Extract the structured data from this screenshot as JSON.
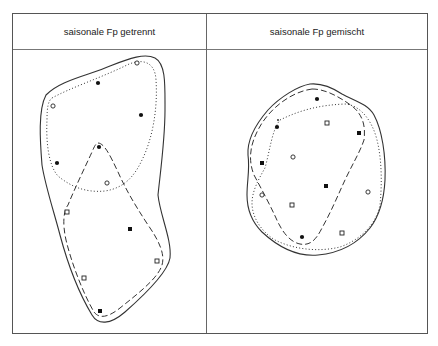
{
  "columns": [
    {
      "title": "saisonale Fp getrennt"
    },
    {
      "title": "saisonale Fp gemischt"
    }
  ],
  "legend_symbols": {
    "filled-circle": "filled circle marker",
    "open-circle": "open circle marker",
    "filled-square": "filled square marker",
    "open-square": "open square marker",
    "solid-outline": "solid outer envelope",
    "dotted-outline": "dotted group envelope",
    "dashed-outline": "dashed group envelope"
  },
  "colors": {
    "line": "#333333",
    "frame": "#555555",
    "background": "#ffffff"
  },
  "left_panel": {
    "markers": [
      {
        "type": "open-circle",
        "x": 137,
        "y": 63
      },
      {
        "type": "filled-circle",
        "x": 98,
        "y": 83
      },
      {
        "type": "open-circle",
        "x": 53,
        "y": 106
      },
      {
        "type": "filled-circle",
        "x": 141,
        "y": 115
      },
      {
        "type": "filled-circle",
        "x": 99,
        "y": 147
      },
      {
        "type": "filled-circle",
        "x": 57,
        "y": 163
      },
      {
        "type": "open-circle",
        "x": 107,
        "y": 183
      },
      {
        "type": "open-square",
        "x": 67,
        "y": 212
      },
      {
        "type": "filled-square",
        "x": 130,
        "y": 229
      },
      {
        "type": "open-square",
        "x": 157,
        "y": 261
      },
      {
        "type": "open-square",
        "x": 84,
        "y": 278
      },
      {
        "type": "filled-square",
        "x": 100,
        "y": 311
      }
    ]
  },
  "right_panel": {
    "markers": [
      {
        "type": "filled-circle",
        "x": 317,
        "y": 99
      },
      {
        "type": "filled-circle",
        "x": 277,
        "y": 127
      },
      {
        "type": "open-square",
        "x": 327,
        "y": 123
      },
      {
        "type": "filled-square",
        "x": 359,
        "y": 133
      },
      {
        "type": "open-circle",
        "x": 293,
        "y": 157
      },
      {
        "type": "filled-square",
        "x": 262,
        "y": 163
      },
      {
        "type": "filled-square",
        "x": 326,
        "y": 186
      },
      {
        "type": "open-circle",
        "x": 368,
        "y": 192
      },
      {
        "type": "open-circle",
        "x": 262,
        "y": 195
      },
      {
        "type": "open-square",
        "x": 292,
        "y": 205
      },
      {
        "type": "open-square",
        "x": 342,
        "y": 233
      },
      {
        "type": "filled-circle",
        "x": 302,
        "y": 237
      }
    ]
  }
}
